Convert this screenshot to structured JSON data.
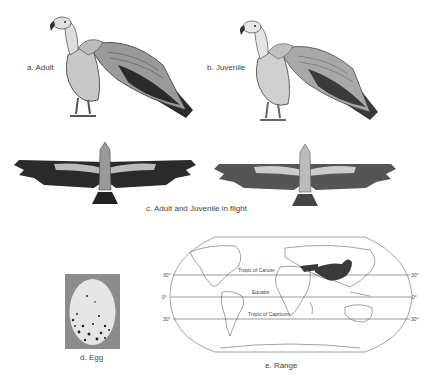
{
  "panels": {
    "adult": {
      "label": "a. Adult"
    },
    "juvenile": {
      "label": "b. Juvenile"
    },
    "flight": {
      "label": "c. Adult and Juvenile in flight"
    },
    "egg": {
      "label": "d. Egg"
    },
    "range": {
      "label": "e. Range",
      "lines": {
        "tropic_cancer": "Tropic of Cancer",
        "equator": "Equator",
        "tropic_capricorn": "Tropic of Capricorn"
      },
      "lat_left": [
        "30°",
        "0°",
        "30°"
      ],
      "lat_right": [
        "30°",
        "0°",
        "30°"
      ]
    }
  },
  "colors": {
    "background": "#ffffff",
    "bird_dark": "#2a2a2a",
    "bird_mid": "#8a8a8a",
    "bird_light": "#d8d8d8",
    "egg_bg": "#8c8c8c",
    "egg_shell": "#e6e6e6",
    "range_fill": "#3a3a3a"
  }
}
